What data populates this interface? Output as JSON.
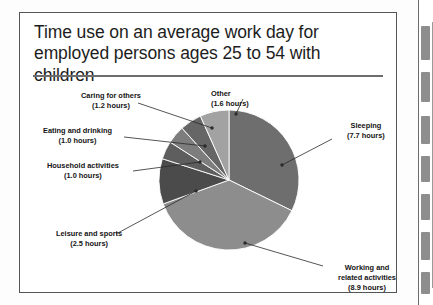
{
  "figure": {
    "title": "Time use on an average work day for employed persons ages 25 to 54 with children"
  },
  "chart_data": {
    "type": "pie",
    "title": "Time use on an average work day for employed persons ages 25 to 54 with children",
    "unit": "hours",
    "total": 24.0,
    "legend_position": "callout-labels",
    "grid": false,
    "categories": [
      "Sleeping",
      "Working and related activities",
      "Leisure and sports",
      "Household activities",
      "Eating and drinking",
      "Caring for others",
      "Other"
    ],
    "values": [
      7.7,
      8.9,
      2.5,
      1.0,
      1.0,
      1.2,
      1.6
    ],
    "colors": [
      "#6e6e6e",
      "#8d8d8d",
      "#4b4b4b",
      "#5e5e5e",
      "#7d7d7d",
      "#666666",
      "#a2a2a2"
    ],
    "slices": [
      {
        "name": "Sleeping",
        "label": "Sleeping",
        "value_label": "(7.7 hours)",
        "value": 7.7,
        "color": "#6e6e6e"
      },
      {
        "name": "Working and related activities",
        "label": "Working and",
        "label2": "related activities",
        "value_label": "(8.9 hours)",
        "value": 8.9,
        "color": "#8d8d8d"
      },
      {
        "name": "Leisure and sports",
        "label": "Leisure and sports",
        "value_label": "(2.5 hours)",
        "value": 2.5,
        "color": "#4b4b4b"
      },
      {
        "name": "Household activities",
        "label": "Household activities",
        "value_label": "(1.0 hours)",
        "value": 1.0,
        "color": "#5e5e5e"
      },
      {
        "name": "Eating and drinking",
        "label": "Eating and drinking",
        "value_label": "(1.0 hours)",
        "value": 1.0,
        "color": "#7d7d7d"
      },
      {
        "name": "Caring for others",
        "label": "Caring for others",
        "value_label": "(1.2 hours)",
        "value": 1.2,
        "color": "#666666"
      },
      {
        "name": "Other",
        "label": "Other",
        "value_label": "(1.6 hours)",
        "value": 1.6,
        "color": "#a2a2a2"
      }
    ]
  },
  "labels": {
    "caring_name": "Caring for others",
    "caring_value": "(1.2 hours)",
    "other_name": "Other",
    "other_value": "(1.6 hours)",
    "eating_name": "Eating and drinking",
    "eating_value": "(1.0 hours)",
    "household_name": "Household activities",
    "household_value": "(1.0 hours)",
    "leisure_name": "Leisure and sports",
    "leisure_value": "(2.5 hours)",
    "sleeping_name": "Sleeping",
    "sleeping_value": "(7.7 hours)",
    "working_name": "Working and",
    "working_name2": "related activities",
    "working_value": "(8.9 hours)"
  }
}
